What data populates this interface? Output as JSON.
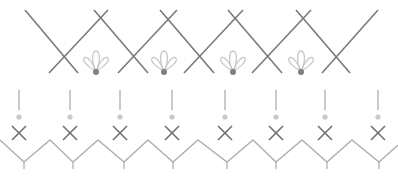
{
  "colors": {
    "background": "#ffffff",
    "lattice_line": "#7a7a7a",
    "flower_outline": "#c8c8c8",
    "flower_dot": "#808080",
    "stem": "#b4b4b4",
    "small_dot": "#c8c8c8",
    "small_cross": "#707070",
    "zigzag": "#b0b0b0"
  },
  "top_lattice": {
    "lines": [
      [
        25,
        10,
        78,
        73
      ],
      [
        49,
        73,
        108,
        10
      ],
      [
        94,
        10,
        148,
        73
      ],
      [
        118,
        73,
        177,
        10
      ],
      [
        160,
        10,
        214,
        73
      ],
      [
        184,
        73,
        243,
        10
      ],
      [
        228,
        10,
        282,
        73
      ],
      [
        252,
        73,
        311,
        10
      ],
      [
        296,
        10,
        350,
        73
      ],
      [
        322,
        73,
        378,
        10
      ]
    ],
    "flowers": [
      {
        "x": 96,
        "y": 71
      },
      {
        "x": 164,
        "y": 71
      },
      {
        "x": 233,
        "y": 71
      },
      {
        "x": 301,
        "y": 71
      }
    ]
  },
  "bottom_border": {
    "motif_x": [
      19,
      70,
      120,
      172,
      225,
      276,
      325,
      378
    ],
    "stem_top": 90,
    "stem_bottom": 110,
    "dot_y": 117,
    "cross_y": 133,
    "zigzag_points": [
      [
        0,
        140
      ],
      [
        24,
        162
      ],
      [
        50,
        140
      ],
      [
        73,
        162
      ],
      [
        98,
        140
      ],
      [
        124,
        162
      ],
      [
        148,
        140
      ],
      [
        173,
        162
      ],
      [
        198,
        140
      ],
      [
        227,
        162
      ],
      [
        253,
        140
      ],
      [
        276,
        162
      ],
      [
        302,
        140
      ],
      [
        327,
        162
      ],
      [
        352,
        140
      ],
      [
        379,
        162
      ],
      [
        398,
        145
      ]
    ],
    "tick_length": 7
  }
}
